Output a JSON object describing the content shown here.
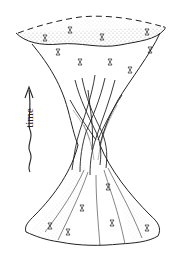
{
  "figure": {
    "axis_label": "time",
    "arrow_direction": "up",
    "colors": {
      "ink": "#222222",
      "background": "#ffffff"
    }
  }
}
